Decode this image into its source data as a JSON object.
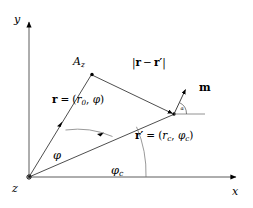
{
  "figure": {
    "background_color": "#ffffff",
    "line_color": "#000000",
    "axes": {
      "y_label": "y",
      "x_label": "x",
      "origin_label": "z"
    },
    "points": {
      "field_point_label": "A",
      "field_point_sub": "z"
    },
    "labels": {
      "distance": "|r − r′|",
      "distance_parts": {
        "bar_open": "|",
        "r": "r",
        "minus": "−",
        "r_prime": "r′",
        "bar_close": "|"
      },
      "r_vector": "r = (r₀, φ)",
      "r_vector_parts": {
        "symbol": "r",
        "equals": "=",
        "open": "(",
        "radial": "r",
        "radial_sub": "0",
        "comma": ", ",
        "angle": "φ",
        "close": ")"
      },
      "r_prime_vector": "r′ = (r_c, φ_c)",
      "r_prime_vector_parts": {
        "symbol": "r",
        "prime": "′",
        "equals": "=",
        "open": "(",
        "radial": "r",
        "radial_sub": "c",
        "comma": ", ",
        "angle": "φ",
        "angle_sub": "c",
        "close": ")"
      },
      "moment": "m",
      "angle_phi": "φ",
      "angle_phi_c": "φ",
      "angle_phi_c_sub": "c",
      "angle_alpha": "α"
    },
    "geometry": {
      "origin": [
        29,
        177
      ],
      "field_point": [
        92,
        74
      ],
      "source_point": [
        174,
        114
      ],
      "moment_tip": [
        186,
        88
      ],
      "y_axis_top": [
        29,
        19
      ],
      "x_axis_right": [
        239,
        177
      ],
      "phi_deg": 58,
      "phi_c_deg": 23,
      "alpha_deg": 65
    }
  }
}
